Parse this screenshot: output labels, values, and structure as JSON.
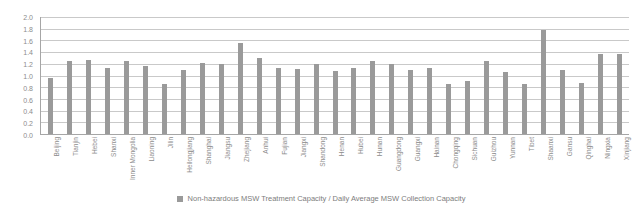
{
  "chart_data": {
    "type": "bar",
    "title": "",
    "subtitle": "",
    "xlabel": "",
    "ylabel": "",
    "ylim": [
      0.0,
      2.0
    ],
    "ytick_labels": [
      "2.0",
      "1.8",
      "1.6",
      "1.4",
      "1.2",
      "1.0",
      "0.8",
      "0.6",
      "0.4",
      "0.2",
      "0.0"
    ],
    "ytick_values": [
      2.0,
      1.8,
      1.6,
      1.4,
      1.2,
      1.0,
      0.8,
      0.6,
      0.4,
      0.2,
      0.0
    ],
    "grid": true,
    "legend_position": "bottom",
    "legend": [
      "Non-hazardous MSW Treatment Capacity / Daily Average MSW Collection Capacity"
    ],
    "series_name": "Non-hazardous MSW Treatment Capacity / Daily Average MSW Collection Capacity",
    "bar_color": "#9a9a9a",
    "grid_color": "#c9c9c9",
    "axis_color": "#a6a6a6",
    "text_color": "#8c8c8c",
    "categories": [
      "Beijing",
      "Tianjin",
      "Hebei",
      "Shanxi",
      "Inner Mongolia",
      "Liaoning",
      "Jilin",
      "Heilongjiang",
      "Shanghai",
      "Jiangsu",
      "Zhejiang",
      "Anhui",
      "Fujian",
      "Jiangxi",
      "Shandong",
      "Henan",
      "Hubei",
      "Hunan",
      "Guangdong",
      "Guangxi",
      "Hainan",
      "Chongqing",
      "Sichuan",
      "Guizhou",
      "Yunnan",
      "Tibet",
      "Shaanxi",
      "Gansu",
      "Qinghai",
      "Ningxia",
      "Xinjiang"
    ],
    "values": [
      0.95,
      1.25,
      1.27,
      1.13,
      1.24,
      1.16,
      0.85,
      1.1,
      1.22,
      1.2,
      1.55,
      1.3,
      1.12,
      1.11,
      1.19,
      1.08,
      1.13,
      1.24,
      1.2,
      1.1,
      1.12,
      0.85,
      0.9,
      1.25,
      1.06,
      0.85,
      1.78,
      1.1,
      0.88,
      1.37,
      1.37
    ]
  }
}
